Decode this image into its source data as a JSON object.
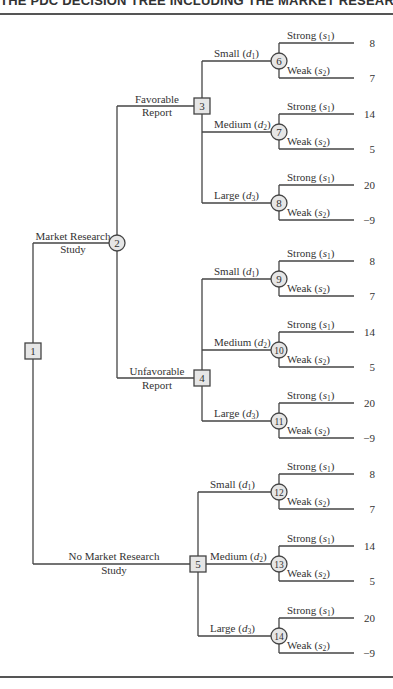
{
  "header": {
    "title": "THE PDC DECISION TREE INCLUDING THE MARKET RESEARCH STUDY"
  },
  "colors": {
    "line": "#444444",
    "node_fill": "#e6e6e6",
    "text": "#333333"
  },
  "tree": {
    "root": {
      "id": "1",
      "type": "decision",
      "x": 33,
      "y": 351
    },
    "branches_from_root": [
      {
        "label_line1": "Market Research",
        "label_line2": "Study",
        "to": "2"
      },
      {
        "label_line1": "No Market Research",
        "label_line2": "Study",
        "to": "5"
      }
    ],
    "nodes": {
      "2": {
        "type": "chance",
        "x": 117,
        "y": 243
      },
      "3": {
        "type": "decision",
        "x": 202,
        "y": 106
      },
      "4": {
        "type": "decision",
        "x": 202,
        "y": 378
      },
      "5": {
        "type": "decision",
        "x": 198,
        "y": 564
      }
    },
    "report_branches": [
      {
        "label_line1": "Favorable",
        "label_line2": "Report",
        "to": "3"
      },
      {
        "label_line1": "Unfavorable",
        "label_line2": "Report",
        "to": "4"
      }
    ],
    "decision_groups": [
      {
        "from": "3",
        "alternatives": [
          {
            "label": "Small",
            "sub": "1",
            "node": "6",
            "y": 61,
            "outcomes": [
              {
                "label": "Strong",
                "sub": "1",
                "value": "8"
              },
              {
                "label": "Weak",
                "sub": "2",
                "value": "7"
              }
            ]
          },
          {
            "label": "Medium",
            "sub": "2",
            "node": "7",
            "y": 132,
            "outcomes": [
              {
                "label": "Strong",
                "sub": "1",
                "value": "14"
              },
              {
                "label": "Weak",
                "sub": "2",
                "value": "5"
              }
            ]
          },
          {
            "label": "Large",
            "sub": "3",
            "node": "8",
            "y": 203,
            "outcomes": [
              {
                "label": "Strong",
                "sub": "1",
                "value": "20"
              },
              {
                "label": "Weak",
                "sub": "2",
                "value": "−9"
              }
            ]
          }
        ]
      },
      {
        "from": "4",
        "alternatives": [
          {
            "label": "Small",
            "sub": "1",
            "node": "9",
            "y": 279,
            "outcomes": [
              {
                "label": "Strong",
                "sub": "1",
                "value": "8"
              },
              {
                "label": "Weak",
                "sub": "2",
                "value": "7"
              }
            ]
          },
          {
            "label": "Medium",
            "sub": "2",
            "node": "10",
            "y": 350,
            "outcomes": [
              {
                "label": "Strong",
                "sub": "1",
                "value": "14"
              },
              {
                "label": "Weak",
                "sub": "2",
                "value": "5"
              }
            ]
          },
          {
            "label": "Large",
            "sub": "3",
            "node": "11",
            "y": 421,
            "outcomes": [
              {
                "label": "Strong",
                "sub": "1",
                "value": "20"
              },
              {
                "label": "Weak",
                "sub": "2",
                "value": "−9"
              }
            ]
          }
        ]
      },
      {
        "from": "5",
        "alternatives": [
          {
            "label": "Small",
            "sub": "1",
            "node": "12",
            "y": 492,
            "outcomes": [
              {
                "label": "Strong",
                "sub": "1",
                "value": "8"
              },
              {
                "label": "Weak",
                "sub": "2",
                "value": "7"
              }
            ]
          },
          {
            "label": "Medium",
            "sub": "2",
            "node": "13",
            "y": 564,
            "outcomes": [
              {
                "label": "Strong",
                "sub": "1",
                "value": "14"
              },
              {
                "label": "Weak",
                "sub": "2",
                "value": "5"
              }
            ]
          },
          {
            "label": "Large",
            "sub": "3",
            "node": "14",
            "y": 636,
            "outcomes": [
              {
                "label": "Strong",
                "sub": "1",
                "value": "20"
              },
              {
                "label": "Weak",
                "sub": "2",
                "value": "−9"
              }
            ]
          }
        ]
      }
    ]
  }
}
